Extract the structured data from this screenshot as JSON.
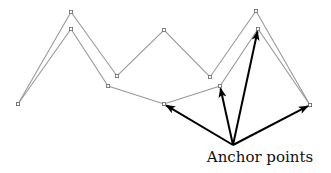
{
  "diagram": {
    "label": "Anchor points",
    "colors": {
      "line": "#9a9a9a",
      "marker": "#6a6a6a",
      "arrow": "#000000",
      "text": "#111111"
    },
    "upper_path": [
      [
        18,
        104
      ],
      [
        71,
        12
      ],
      [
        117,
        76
      ],
      [
        164,
        30
      ],
      [
        210,
        77
      ],
      [
        256,
        11
      ],
      [
        310,
        105
      ]
    ],
    "lower_path": [
      [
        18,
        104
      ],
      [
        71,
        29
      ],
      [
        108,
        86
      ],
      [
        164,
        104
      ],
      [
        220,
        86
      ],
      [
        258,
        29
      ],
      [
        310,
        105
      ]
    ],
    "arrow_origin": [
      233,
      145
    ],
    "arrow_targets": [
      [
        164,
        104
      ],
      [
        220,
        86
      ],
      [
        258,
        29
      ],
      [
        310,
        105
      ]
    ],
    "label_position": [
      260,
      162
    ]
  }
}
